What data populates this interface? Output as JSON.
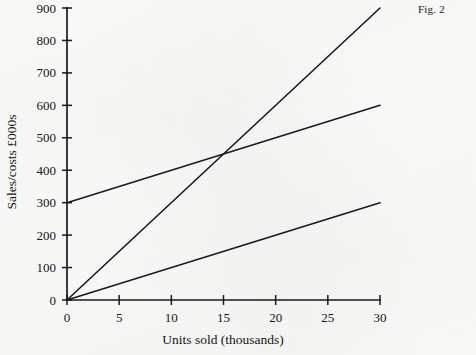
{
  "figure": {
    "caption": "Fig. 2"
  },
  "chart_data": {
    "type": "line",
    "title": "",
    "subtitle": "",
    "xlabel": "Units sold (thousands)",
    "ylabel": "Sales/costs £000s",
    "xlim": [
      0,
      30
    ],
    "ylim": [
      0,
      900
    ],
    "xticks": [
      0,
      5,
      10,
      15,
      20,
      25,
      30
    ],
    "yticks": [
      0,
      100,
      200,
      300,
      400,
      500,
      600,
      700,
      800,
      900
    ],
    "xtick_labels": [
      "0",
      "5",
      "10",
      "15",
      "20",
      "25",
      "30"
    ],
    "ytick_labels": [
      "0",
      "100",
      "200",
      "300",
      "400",
      "500",
      "600",
      "700",
      "800",
      "900"
    ],
    "grid": false,
    "legend": "none",
    "line_color": "#1a1a1a",
    "axis_color": "#1a1a1a",
    "background": "#fdfdfb",
    "series": [
      {
        "name": "sales-revenue",
        "x": [
          0,
          30
        ],
        "values": [
          0,
          900
        ],
        "slope": 30,
        "intercept": 0
      },
      {
        "name": "total-costs",
        "x": [
          0,
          30
        ],
        "values": [
          300,
          600
        ],
        "slope": 10,
        "intercept": 300
      },
      {
        "name": "variable-costs",
        "x": [
          0,
          30
        ],
        "values": [
          0,
          300
        ],
        "slope": 10,
        "intercept": 0
      }
    ],
    "annotations": [
      {
        "name": "break-even-point",
        "x": 15,
        "y": 450,
        "label": ""
      }
    ]
  }
}
